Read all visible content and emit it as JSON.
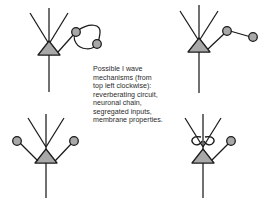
{
  "figure": {
    "caption": "Possible I wave mechanisms (from top left clockwise): reverberating circuit, neuronal chain, segregated inputs, membrane properties.",
    "background_color": "#ffffff"
  },
  "style": {
    "soma_fill": "#a8a8a8",
    "soma_stroke": "#1a1a1a",
    "circle_fill": "#a8a8a8",
    "circle_stroke": "#1a1a1a",
    "line_color": "#1a1a1a",
    "text_color": "#2b2b2b"
  },
  "panels": [
    {
      "id": "top-left",
      "mechanism": "reverberating circuit",
      "position": "top left",
      "neuron": {
        "soma_shape": "triangle",
        "apical_dendrite": true,
        "oblique_dendrites": 2,
        "axon": true
      },
      "interneurons": 2,
      "connection_pattern": "closed loop"
    },
    {
      "id": "top-right",
      "mechanism": "neuronal chain",
      "position": "top right",
      "neuron": {
        "soma_shape": "triangle",
        "apical_dendrite": true,
        "oblique_dendrites": 2,
        "axon": true
      },
      "interneurons": 2,
      "connection_pattern": "serial chain"
    },
    {
      "id": "bottom-left",
      "mechanism": "segregated inputs",
      "position": "bottom left",
      "neuron": {
        "soma_shape": "triangle",
        "apical_dendrite": true,
        "oblique_dendrites": 2,
        "axon": true
      },
      "interneurons": 2,
      "connection_pattern": "parallel converging inputs"
    },
    {
      "id": "bottom-right",
      "mechanism": "membrane properties",
      "position": "bottom right",
      "neuron": {
        "soma_shape": "triangle",
        "apical_dendrite": true,
        "oblique_dendrites": 2,
        "axon": true
      },
      "interneurons": 1,
      "connection_pattern": "membrane loops on dendrite"
    }
  ]
}
